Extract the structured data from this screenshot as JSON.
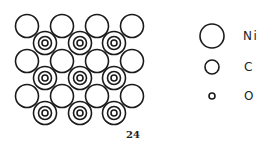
{
  "diagram": {
    "figure_number": "24",
    "lattice": {
      "ni_columns_x": [
        27,
        62,
        97,
        132
      ],
      "ni_rows_y": [
        26,
        61,
        96
      ],
      "ni_radius": 11.5,
      "co_columns_x": [
        45,
        80,
        114
      ],
      "co_rows_y": [
        43,
        78,
        113
      ],
      "co_radii": [
        11.5,
        6.5,
        3
      ]
    },
    "legend": [
      {
        "symbol": "large-circle",
        "label": "Ni",
        "radius": 12
      },
      {
        "symbol": "medium-circle",
        "label": "C",
        "radius": 7
      },
      {
        "symbol": "small-circle",
        "label": "O",
        "radius": 3
      }
    ],
    "colors": {
      "stroke": "#1a1a1a",
      "background": "#ffffff",
      "text": "#222222"
    }
  }
}
